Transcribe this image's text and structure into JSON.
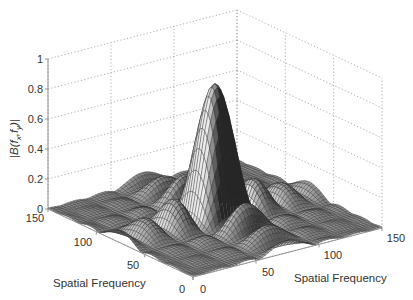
{
  "chart_data": {
    "type": "surface",
    "title": "",
    "function": "2D sinc magnitude |B(fx,fy)| = |sinc(fx)*sinc(fy)| centered at (75,75)",
    "xlabel": "Spatial Frequency",
    "ylabel": "Spatial Frequency",
    "zlabel": "|B(f_x,f_y)|",
    "x_range": [
      0,
      150
    ],
    "y_range": [
      0,
      150
    ],
    "zlim": [
      0,
      1
    ],
    "x_ticks": [
      "0",
      "50",
      "100",
      "150"
    ],
    "y_ticks": [
      "0",
      "50",
      "100",
      "150"
    ],
    "z_ticks": [
      "0",
      "0.2",
      "0.4",
      "0.6",
      "0.8",
      "1"
    ],
    "peak": {
      "x": 75,
      "y": 75,
      "z": 0.9
    },
    "side_lobe_height_approx": 0.35,
    "grid": true,
    "colormap": "grayscale wireframe"
  },
  "axes": {
    "zlabel": "|B(f_x,f_y)|",
    "zlabel_main": "|B(f",
    "zlabel_sub1": "x",
    "zlabel_mid": ",f",
    "zlabel_sub2": "y",
    "zlabel_end": ")|",
    "left_axis_label": "Spatial Frequency",
    "right_axis_label": "Spatial Frequency",
    "z_ticks": [
      "0",
      "0.2",
      "0.4",
      "0.6",
      "0.8",
      "1"
    ],
    "left_ticks": [
      "0",
      "50",
      "100",
      "150"
    ],
    "right_ticks": [
      "0",
      "50",
      "100",
      "150"
    ]
  }
}
